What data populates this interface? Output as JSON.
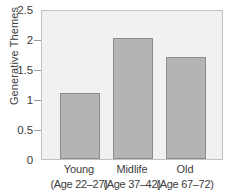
{
  "chart_data": {
    "type": "bar",
    "title": "",
    "subtitle": "",
    "xlabel": "",
    "ylabel": "Generative Themes",
    "categories": [
      "Young",
      "Midlife",
      "Old"
    ],
    "category_sublabels": [
      "(Age 22–27)",
      "(Age 37–42)",
      "(Age 67–72)"
    ],
    "values": [
      1.12,
      2.05,
      1.73
    ],
    "ylim": [
      0,
      2.5
    ],
    "ytick_values": [
      0,
      0.5,
      1,
      1.5,
      2,
      2.5
    ],
    "ytick_labels": [
      "0",
      "0.5",
      "1",
      "1.5",
      "2",
      "2.5"
    ],
    "grid": false,
    "legend": false,
    "legend_position": "none",
    "colors": {
      "bar_fill": "#b4b4b4",
      "bar_border": "#8c8c8c",
      "plot_background": "#f1f1f1",
      "plot_border": "#c2c2c2",
      "figure_background": "#ffffff",
      "text": "#3d3d3d",
      "tick_mark": "#9a9a9a"
    }
  }
}
